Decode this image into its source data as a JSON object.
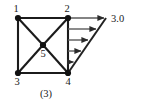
{
  "figure": {
    "caption": "(3)",
    "type": "structural-frame-diagram",
    "colors": {
      "member": "#1b1b1b",
      "node": "#111111",
      "load_arrow": "#4a4a4a",
      "load_envelope": "#222222",
      "text": "#1a1a1a",
      "background": "#ffffff"
    },
    "nodes": [
      {
        "id": "1",
        "label": "1",
        "x": 18,
        "y": 18,
        "label_x": 16,
        "label_y": 11
      },
      {
        "id": "2",
        "label": "2",
        "x": 68,
        "y": 18,
        "label_x": 66,
        "label_y": 11
      },
      {
        "id": "3",
        "label": "3",
        "x": 18,
        "y": 73,
        "label_x": 16,
        "label_y": 85
      },
      {
        "id": "4",
        "label": "4",
        "x": 68,
        "y": 73,
        "label_x": 66,
        "label_y": 85
      },
      {
        "id": "5",
        "label": "5",
        "x": 43,
        "y": 45,
        "label_x": 41,
        "label_y": 57
      }
    ],
    "members": [
      {
        "name": "member-1-2",
        "from": "1",
        "to": "2"
      },
      {
        "name": "member-1-3",
        "from": "1",
        "to": "3"
      },
      {
        "name": "member-2-4",
        "from": "2",
        "to": "4"
      },
      {
        "name": "member-3-4",
        "from": "3",
        "to": "4"
      },
      {
        "name": "member-1-5",
        "from": "1",
        "to": "5"
      },
      {
        "name": "member-2-5",
        "from": "2",
        "to": "5"
      },
      {
        "name": "member-3-5",
        "from": "3",
        "to": "5"
      },
      {
        "name": "member-4-5",
        "from": "4",
        "to": "5"
      }
    ],
    "load": {
      "label": "3.0",
      "label_x": 112,
      "label_y": 22,
      "direction": "right",
      "distribution": "triangular",
      "applied_edge": "2-4",
      "peak_at_node": "2",
      "zero_at_node": "4",
      "envelope": {
        "tip_x": 106,
        "tip_y": 18,
        "base_x": 68,
        "base_y": 73
      },
      "arrows": [
        {
          "y": 18,
          "x_start": 68,
          "x_end": 106
        },
        {
          "y": 29,
          "x_start": 68,
          "x_end": 98
        },
        {
          "y": 40,
          "x_start": 68,
          "x_end": 90
        },
        {
          "y": 51,
          "x_start": 68,
          "x_end": 83
        },
        {
          "y": 62,
          "x_start": 68,
          "x_end": 75
        }
      ]
    }
  }
}
